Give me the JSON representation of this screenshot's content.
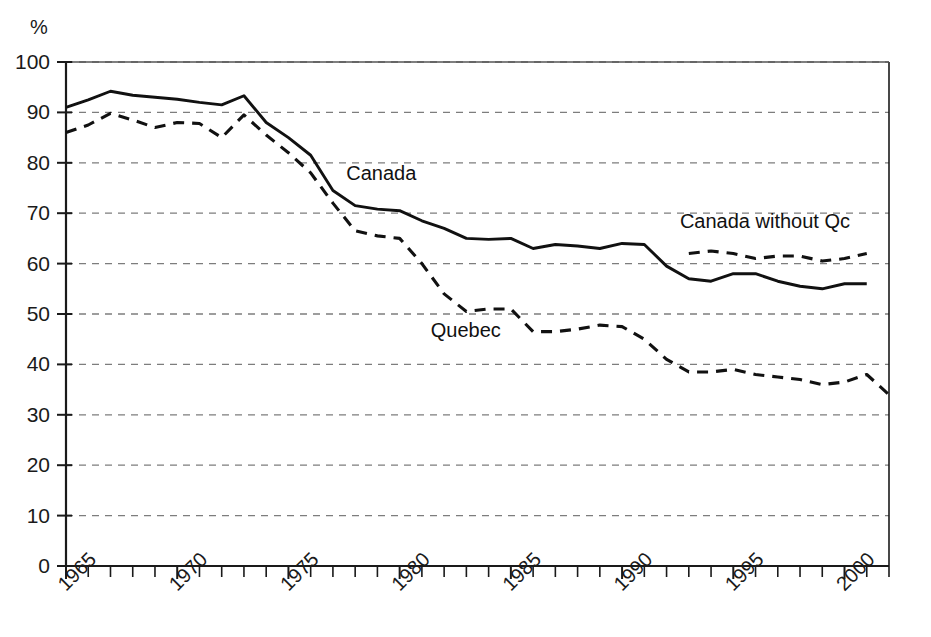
{
  "chart_data": {
    "type": "line",
    "title": "",
    "subtitle": "",
    "xlabel": "",
    "ylabel": "%",
    "unit_label": "%",
    "xlim": [
      1965,
      2002
    ],
    "ylim": [
      0,
      100
    ],
    "ytick_step": 10,
    "xtick_step": 1,
    "xtick_label_step": 5,
    "grid": "horizontal-dashed",
    "legend_position": "inline-annotations",
    "yticks": [
      0,
      10,
      20,
      30,
      40,
      50,
      60,
      70,
      80,
      90,
      100
    ],
    "xticks": [
      1965,
      1966,
      1967,
      1968,
      1969,
      1970,
      1971,
      1972,
      1973,
      1974,
      1975,
      1976,
      1977,
      1978,
      1979,
      1980,
      1981,
      1982,
      1983,
      1984,
      1985,
      1986,
      1987,
      1988,
      1989,
      1990,
      1991,
      1992,
      1993,
      1994,
      1995,
      1996,
      1997,
      1998,
      1999,
      2000,
      2001,
      2002
    ],
    "xtick_labels": [
      "1965",
      "1970",
      "1975",
      "1980",
      "1985",
      "1990",
      "1995",
      "2000"
    ],
    "xtick_label_years": [
      1965,
      1970,
      1975,
      1980,
      1985,
      1990,
      1995,
      2000
    ],
    "series": [
      {
        "name": "Canada",
        "style": "solid",
        "color": "#111111",
        "label": "Canada",
        "label_x": 1977.6,
        "label_y": 76.5,
        "x": [
          1965,
          1966,
          1967,
          1968,
          1969,
          1970,
          1971,
          1972,
          1973,
          1974,
          1975,
          1976,
          1977,
          1978,
          1979,
          1980,
          1981,
          1982,
          1983,
          1984,
          1985,
          1986,
          1987,
          1988,
          1989,
          1990,
          1991,
          1992,
          1993,
          1994,
          1995,
          1996,
          1997,
          1998,
          1999,
          2000,
          2001
        ],
        "values": [
          91.0,
          92.5,
          94.2,
          93.4,
          93.0,
          92.6,
          92.0,
          91.5,
          93.3,
          88.0,
          85.0,
          81.5,
          74.5,
          71.5,
          70.8,
          70.5,
          68.5,
          67.0,
          65.0,
          64.8,
          65.0,
          63.0,
          63.8,
          63.5,
          63.0,
          64.0,
          63.8,
          59.5,
          57.0,
          56.5,
          58.0,
          58.0,
          56.5,
          55.5,
          55.0,
          56.0,
          56.0
        ]
      },
      {
        "name": "Quebec",
        "style": "dashed",
        "color": "#111111",
        "label": "Quebec",
        "label_x": 1981.4,
        "label_y": 45.5,
        "x": [
          1965,
          1966,
          1967,
          1968,
          1969,
          1970,
          1971,
          1972,
          1973,
          1974,
          1975,
          1976,
          1977,
          1978,
          1979,
          1980,
          1981,
          1982,
          1983,
          1984,
          1985,
          1986,
          1987,
          1988,
          1989,
          1990,
          1991,
          1992,
          1993,
          1994,
          1995,
          1996,
          1997,
          1998,
          1999,
          2000,
          2001,
          2002
        ],
        "values": [
          86.0,
          87.5,
          89.8,
          88.5,
          87.0,
          88.0,
          87.8,
          85.0,
          89.5,
          85.5,
          82.0,
          78.0,
          72.0,
          66.5,
          65.5,
          65.0,
          60.0,
          54.0,
          50.5,
          51.0,
          51.0,
          46.5,
          46.5,
          47.0,
          47.8,
          47.5,
          45.0,
          41.0,
          38.5,
          38.5,
          39.0,
          38.0,
          37.5,
          37.0,
          36.0,
          36.5,
          38.0,
          34.0
        ]
      },
      {
        "name": "Canada without Qc",
        "style": "dashed",
        "color": "#111111",
        "label": "Canada without Qc",
        "label_x": 1992.6,
        "label_y": 67.0,
        "x": [
          1993,
          1994,
          1995,
          1996,
          1997,
          1998,
          1999,
          2000,
          2001
        ],
        "values": [
          62.0,
          62.5,
          62.0,
          61.0,
          61.5,
          61.5,
          60.5,
          61.0,
          62.0
        ]
      }
    ]
  }
}
